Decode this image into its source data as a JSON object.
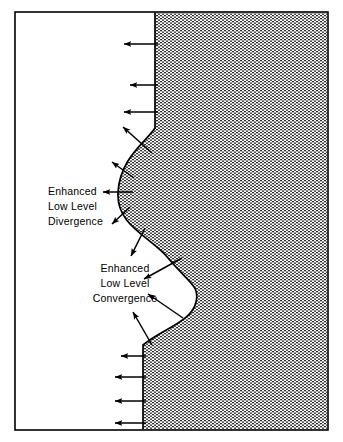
{
  "figure": {
    "type": "schematic-diagram",
    "background_color": "#ffffff",
    "line_color": "#000000",
    "shaded_fill_color": "#9a9a9a",
    "frame": {
      "name": "outer-border",
      "x": 15,
      "y": 12,
      "width": 313,
      "height": 418,
      "stroke_width": 1.6
    }
  },
  "regions": [
    {
      "name": "clear-region",
      "label": "",
      "fill": "#ffffff",
      "side": "left"
    },
    {
      "name": "shaded-air-mass",
      "label": "",
      "fill_pattern": "fine-horizontal-stipple",
      "side": "right"
    }
  ],
  "boundary": {
    "name": "air-mass-boundary",
    "description": "S-shaped wavy boundary: straight upper segment, leftward bulge, rightward bulge, straight lower segment",
    "upper_straight_x": 155,
    "upper_straight_y_top": 12,
    "upper_straight_y_bottom": 128,
    "upper_bulge_extreme_x": 118,
    "upper_bulge_extreme_y": 192,
    "lower_bulge_extreme_x": 196,
    "lower_bulge_extreme_y": 300,
    "lower_straight_x": 143,
    "lower_straight_y_top": 345,
    "lower_straight_y_bottom": 430
  },
  "labels": [
    {
      "name": "divergence-label",
      "align": "left",
      "x": 48,
      "lines": [
        "Enhanced",
        "Low  Level",
        "Divergence"
      ],
      "line_y": [
        195,
        210,
        225
      ]
    },
    {
      "name": "convergence-label",
      "align": "center",
      "x": 125,
      "lines": [
        "Enhanced",
        "Low  Level",
        "Convergence"
      ],
      "line_y": [
        272,
        287,
        302
      ]
    }
  ],
  "arrows": {
    "head_length": 7,
    "head_width": 5.2,
    "shaft_width": 1.5,
    "divergence_group": [
      {
        "name": "arrow-div-top-1",
        "x1": 158,
        "y1": 44,
        "x2": 122,
        "y2": 44
      },
      {
        "name": "arrow-div-top-2",
        "x1": 158,
        "y1": 85,
        "x2": 128,
        "y2": 85
      },
      {
        "name": "arrow-div-top-3",
        "x1": 158,
        "y1": 112,
        "x2": 122,
        "y2": 112
      },
      {
        "name": "arrow-div-diag-1",
        "x1": 152,
        "y1": 153,
        "x2": 121,
        "y2": 125
      },
      {
        "name": "arrow-div-diag-2",
        "x1": 134,
        "y1": 178,
        "x2": 110,
        "y2": 160
      },
      {
        "name": "arrow-div-mid",
        "x1": 133,
        "y1": 192,
        "x2": 101,
        "y2": 192
      },
      {
        "name": "arrow-div-diag-3",
        "x1": 130,
        "y1": 207,
        "x2": 110,
        "y2": 225
      }
    ],
    "convergence_group": [
      {
        "name": "arrow-conv-1",
        "x1": 145,
        "y1": 228,
        "x2": 130,
        "y2": 258
      },
      {
        "name": "arrow-conv-2",
        "x1": 182,
        "y1": 258,
        "x2": 142,
        "y2": 280
      },
      {
        "name": "arrow-conv-3",
        "x1": 183,
        "y1": 318,
        "x2": 146,
        "y2": 292
      },
      {
        "name": "arrow-conv-4",
        "x1": 152,
        "y1": 345,
        "x2": 132,
        "y2": 310
      }
    ],
    "bottom_group": [
      {
        "name": "arrow-bot-1",
        "x1": 146,
        "y1": 356,
        "x2": 119,
        "y2": 356
      },
      {
        "name": "arrow-bot-2",
        "x1": 146,
        "y1": 377,
        "x2": 113,
        "y2": 377
      },
      {
        "name": "arrow-bot-3",
        "x1": 146,
        "y1": 401,
        "x2": 113,
        "y2": 401
      },
      {
        "name": "arrow-bot-4",
        "x1": 146,
        "y1": 423,
        "x2": 113,
        "y2": 423
      }
    ]
  }
}
